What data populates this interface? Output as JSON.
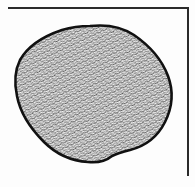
{
  "figure": {
    "type": "illustration",
    "frame": {
      "sides": [
        "top",
        "right"
      ],
      "color": "#2a2a2a"
    },
    "blob": {
      "outline_color": "#111111",
      "fill_texture": "dense squiggle stipple",
      "fill_dark": "#3a3a3a",
      "fill_light": "#f2f2f2"
    },
    "background": "#fdfdfd"
  }
}
